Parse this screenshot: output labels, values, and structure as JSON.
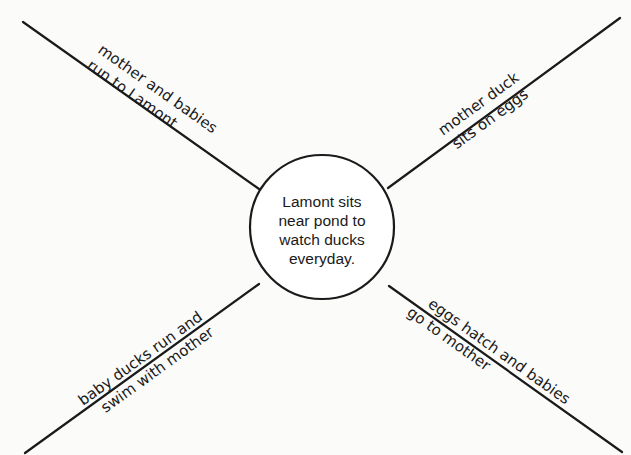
{
  "diagram": {
    "type": "story map / web organizer",
    "center": {
      "lines": [
        "Lamont sits",
        "near pond to",
        "watch ducks",
        "everyday."
      ]
    },
    "spokes": [
      {
        "position": "top-left",
        "line1": "mother and babies",
        "line2": "run to Lamont"
      },
      {
        "position": "top-right",
        "line1": "mother duck",
        "line2": "sits on eggs"
      },
      {
        "position": "bottom-left",
        "line1": "baby ducks run and",
        "line2": "swim with mother"
      },
      {
        "position": "bottom-right",
        "line1": "eggs hatch and babies",
        "line2": "go to mother"
      }
    ],
    "colors": {
      "ink": "#1a1a1a",
      "paper": "#fbfbfa"
    }
  }
}
